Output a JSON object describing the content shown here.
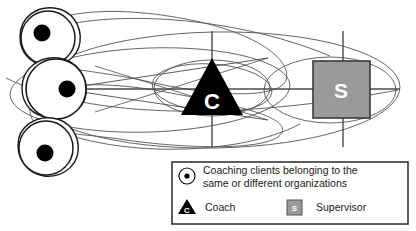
{
  "diagram": {
    "nodes": {
      "coach": {
        "letter": "C",
        "shape": "triangle",
        "fill": "#000000",
        "label_color": "#ffffff"
      },
      "supervisor": {
        "letter": "S",
        "shape": "square",
        "fill": "#9a9a9a",
        "stroke": "#3a3a3a",
        "label_color": "#ffffff"
      },
      "clients": [
        {
          "id": "client-top",
          "shape": "circle",
          "dot_fill": "#000000"
        },
        {
          "id": "client-middle",
          "shape": "circle",
          "dot_fill": "#000000"
        },
        {
          "id": "client-bottom",
          "shape": "circle",
          "dot_fill": "#000000"
        }
      ]
    },
    "line_color": "#4a4a4a",
    "outline_color": "#1a1a1a"
  },
  "legend": {
    "border_color": "#2a2a2a",
    "rows": [
      {
        "icon": "circle-dot-icon",
        "text_line_1": "Coaching clients belonging to the",
        "text_line_2": "same or different organizations"
      },
      {
        "icon": "triangle-coach-icon",
        "text": "Coach"
      },
      {
        "icon": "square-supervisor-icon",
        "text": "Supervisor"
      }
    ]
  }
}
